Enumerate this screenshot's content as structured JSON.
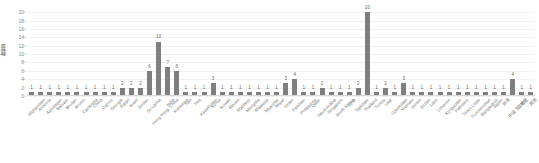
{
  "chart_data": {
    "type": "bar",
    "title": "",
    "xlabel": "",
    "ylabel": "数量",
    "ylim": [
      0,
      21
    ],
    "yticks": [
      0,
      2,
      4,
      6,
      8,
      10,
      12,
      14,
      16,
      18,
      20
    ],
    "grid": true,
    "legend": null,
    "bar_color": "#7f7f7f",
    "show_value_labels": true,
    "categories": [
      "Afghanistan",
      "Armenia",
      "Azerbaijan",
      "Bahrain",
      "Bhutan",
      "Brunei",
      "Cambodia",
      "China",
      "Cyprus",
      "Georgia",
      "Egypt",
      "Israel",
      "Jordan",
      "Sri Lanka",
      "Hong Kong, China",
      "India",
      "Indonesia",
      "Iran",
      "Iraq",
      "Kazakhstan",
      "Korea",
      "Kuwait",
      "Macao",
      "Maldives",
      "Mongolia",
      "Malaysia",
      "Myanmar",
      "Nepal",
      "Oman",
      "Pakistan",
      "Philippines",
      "Qatar",
      "Saudi Arabia",
      "Singapore",
      "South Korea",
      "Syria",
      "Tajikistan",
      "Thailand",
      "Turkey",
      "UAE",
      "Uzbekistan",
      "Vietnam",
      "Yemen",
      "Jordan",
      "Laos",
      "Lebanon",
      "Kyrgyzstan",
      "Palestine",
      "Timor-Leste",
      "Turkmenistan",
      "Bangladesh",
      "Japan",
      "台湾",
      "中亚-东亚地区",
      "合计",
      "其他"
    ],
    "values": [
      1,
      1,
      1,
      1,
      1,
      1,
      1,
      1,
      1,
      1,
      2,
      2,
      2,
      6,
      13,
      7,
      6,
      1,
      1,
      1,
      3,
      1,
      1,
      1,
      1,
      1,
      1,
      1,
      3,
      4,
      1,
      1,
      2,
      1,
      1,
      1,
      2,
      20,
      1,
      2,
      1,
      3,
      1,
      1,
      1,
      1,
      1,
      1,
      1,
      1,
      1,
      1,
      1,
      4,
      1,
      1
    ]
  }
}
